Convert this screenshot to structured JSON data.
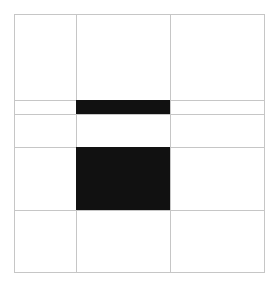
{
  "figure": {
    "canvas": {
      "width": 277,
      "height": 292,
      "background": "#ffffff"
    },
    "frame": {
      "x": 14,
      "y": 14,
      "width": 251,
      "height": 259,
      "line_color": "#c6c6c6",
      "line_width": 1,
      "fill": "#ffffff"
    },
    "grid": {
      "columns": 3,
      "rows": 5,
      "vertical_lines": [
        {
          "name": "column-divider-1",
          "x": 76
        },
        {
          "name": "column-divider-2",
          "x": 170
        }
      ],
      "horizontal_lines": [
        {
          "name": "row-divider-1",
          "y": 100
        },
        {
          "name": "row-divider-2",
          "y": 114
        },
        {
          "name": "row-divider-3",
          "y": 147
        },
        {
          "name": "row-divider-4",
          "y": 210
        }
      ],
      "column_edges": [
        14,
        76,
        170,
        265
      ],
      "row_edges": [
        14,
        100,
        114,
        147,
        210,
        273
      ]
    },
    "blocks": [
      {
        "name": "black-bar-upper",
        "color": "#111111",
        "column": 2,
        "row": 2,
        "x": 76,
        "y": 100,
        "width": 94,
        "height": 14
      },
      {
        "name": "black-block-center",
        "color": "#111111",
        "column": 2,
        "row": 4,
        "x": 76,
        "y": 147,
        "width": 94,
        "height": 63
      }
    ]
  }
}
